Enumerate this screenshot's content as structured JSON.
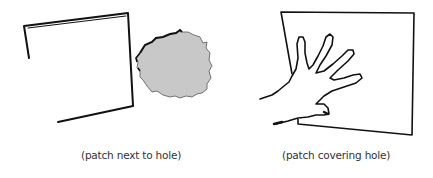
{
  "figure": {
    "panels": [
      {
        "id": "left",
        "caption": "(patch next to hole)",
        "elements": [
          "patch",
          "hole"
        ]
      },
      {
        "id": "right",
        "caption": "(patch covering hole)",
        "elements": [
          "patch",
          "hand"
        ]
      }
    ],
    "colors": {
      "line": "#111111",
      "hole_fill": "#c8c8c8",
      "caption": "#333333",
      "background": "#ffffff"
    }
  }
}
